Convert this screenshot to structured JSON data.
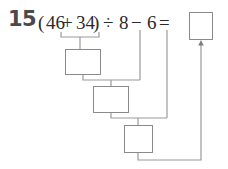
{
  "problem": {
    "number": "15",
    "expression": {
      "open_paren": "(",
      "operand_a": "46",
      "operator_1": "+",
      "operand_b": "34",
      "close_paren": ")",
      "operator_2": "÷",
      "operand_c": "8",
      "operator_3": "−",
      "operand_d": "6",
      "equals": "="
    },
    "full_text": "(46+34)÷8−6=",
    "answer_box_value": "",
    "work_boxes": [
      {
        "id": "step-1",
        "value": "",
        "computes": "46+34"
      },
      {
        "id": "step-2",
        "value": "",
        "computes": "step-1 ÷ 8"
      },
      {
        "id": "step-3",
        "value": "",
        "computes": "step-2 − 6"
      }
    ]
  },
  "colors": {
    "box_border": "#8a8a8a",
    "connector": "#9a9a9a",
    "number_text": "#4a4a4a",
    "expression_text": "#2b2b2b",
    "background": "#ffffff"
  }
}
